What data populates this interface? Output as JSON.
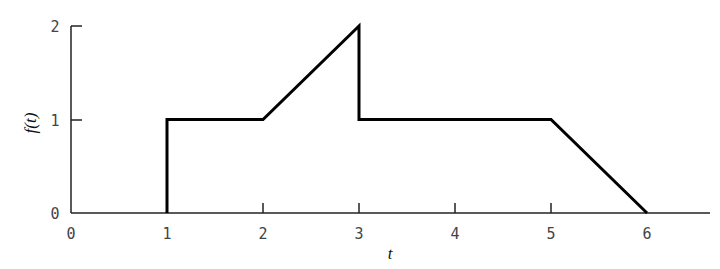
{
  "chart_data": {
    "type": "line",
    "title": "",
    "xlabel": "t",
    "ylabel": "f(t)",
    "xlim": [
      0,
      6.6
    ],
    "ylim": [
      0,
      2
    ],
    "grid": false,
    "legend": null,
    "x_ticks": [
      "0",
      "1",
      "2",
      "3",
      "4",
      "5",
      "6"
    ],
    "y_ticks": [
      "0",
      "1",
      "2"
    ],
    "series": [
      {
        "name": "f(t)",
        "points": [
          [
            0,
            0
          ],
          [
            1,
            0
          ],
          [
            1,
            1
          ],
          [
            2,
            1
          ],
          [
            3,
            2
          ],
          [
            3,
            1
          ],
          [
            5,
            1
          ],
          [
            6,
            0
          ],
          [
            6.6,
            0
          ]
        ]
      }
    ]
  },
  "labels": {
    "xlabel": "t",
    "ylabel": "f(t)",
    "x_ticks": [
      "0",
      "1",
      "2",
      "3",
      "4",
      "5",
      "6"
    ],
    "y_ticks": [
      "0",
      "1",
      "2"
    ]
  }
}
